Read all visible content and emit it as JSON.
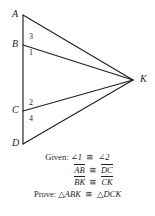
{
  "figure": {
    "type": "geometry-diagram",
    "background_color": "#ffffff",
    "stroke_color": "#231f20",
    "vertices": [
      {
        "label": "A",
        "x": 23,
        "y": 15,
        "label_x": 12,
        "label_y": 10
      },
      {
        "label": "B",
        "x": 23,
        "y": 45,
        "label_x": 12,
        "label_y": 40
      },
      {
        "label": "C",
        "x": 23,
        "y": 111,
        "label_x": 12,
        "label_y": 106
      },
      {
        "label": "D",
        "x": 23,
        "y": 144,
        "label_x": 12,
        "label_y": 139
      },
      {
        "label": "K",
        "x": 133,
        "y": 80,
        "label_x": 140,
        "label_y": 74
      }
    ],
    "segments": [
      {
        "name": "AD",
        "from": "A",
        "to": "D"
      },
      {
        "name": "AK",
        "from": "A",
        "to": "K"
      },
      {
        "name": "BK",
        "from": "B",
        "to": "K"
      },
      {
        "name": "CK",
        "from": "C",
        "to": "K"
      },
      {
        "name": "DK",
        "from": "D",
        "to": "K"
      }
    ],
    "angle_labels": [
      {
        "label": "3",
        "x": 29,
        "y": 33
      },
      {
        "label": "1",
        "x": 29,
        "y": 49
      },
      {
        "label": "2",
        "x": 29,
        "y": 99
      },
      {
        "label": "4",
        "x": 29,
        "y": 115
      }
    ]
  },
  "proof": {
    "given_keyword": "Given:",
    "prove_keyword": "Prove:",
    "congruent_symbol": "≅",
    "angle_symbol": "∠",
    "triangle_symbol": "△",
    "lines": [
      {
        "id": "given-angles",
        "keyword": "Given:",
        "left": "∠1",
        "right": "∠2"
      },
      {
        "id": "given-ab-dc",
        "keyword": "",
        "left": "AB",
        "right": "DC"
      },
      {
        "id": "given-bk-ck",
        "keyword": "",
        "left": "BK",
        "right": "CK"
      },
      {
        "id": "prove-triangles",
        "keyword": "Prove:",
        "left": "△ABK",
        "right": "△DCK"
      }
    ]
  }
}
